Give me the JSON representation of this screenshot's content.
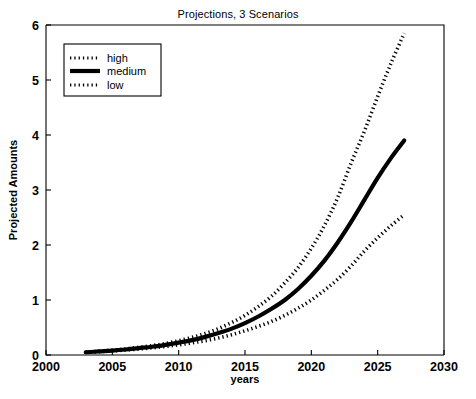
{
  "chart_data": {
    "type": "line",
    "title": "Projections, 3 Scenarios",
    "xlabel": "years",
    "ylabel": "Projected Amounts",
    "xlim": [
      2000,
      2030
    ],
    "ylim": [
      0,
      6
    ],
    "xticks": [
      2000,
      2005,
      2010,
      2015,
      2020,
      2025,
      2030
    ],
    "yticks": [
      0,
      1,
      2,
      3,
      4,
      5,
      6
    ],
    "grid": false,
    "legend_position": "upper-left",
    "x": [
      2003,
      2004,
      2005,
      2006,
      2007,
      2008,
      2009,
      2010,
      2011,
      2012,
      2013,
      2014,
      2015,
      2016,
      2017,
      2018,
      2019,
      2020,
      2021,
      2022,
      2023,
      2024,
      2025,
      2026,
      2027
    ],
    "series": [
      {
        "name": "high",
        "style": "dotted",
        "values": [
          0.05,
          0.07,
          0.09,
          0.11,
          0.14,
          0.17,
          0.21,
          0.26,
          0.32,
          0.39,
          0.48,
          0.59,
          0.72,
          0.88,
          1.07,
          1.31,
          1.59,
          1.94,
          2.36,
          2.87,
          3.49,
          4.07,
          4.7,
          5.3,
          5.85
        ]
      },
      {
        "name": "medium",
        "style": "solid",
        "values": [
          0.05,
          0.065,
          0.08,
          0.1,
          0.125,
          0.15,
          0.185,
          0.225,
          0.27,
          0.33,
          0.4,
          0.48,
          0.58,
          0.7,
          0.84,
          1.0,
          1.2,
          1.44,
          1.72,
          2.05,
          2.42,
          2.82,
          3.22,
          3.58,
          3.9
        ]
      },
      {
        "name": "low",
        "style": "dotted",
        "values": [
          0.05,
          0.06,
          0.075,
          0.09,
          0.11,
          0.13,
          0.155,
          0.185,
          0.22,
          0.26,
          0.31,
          0.37,
          0.44,
          0.52,
          0.61,
          0.72,
          0.85,
          1.0,
          1.18,
          1.38,
          1.62,
          1.89,
          2.13,
          2.35,
          2.55
        ]
      }
    ]
  },
  "legend": {
    "entries": [
      {
        "label": "high"
      },
      {
        "label": "medium"
      },
      {
        "label": "low"
      }
    ]
  },
  "axes": {
    "x_tick_labels": [
      "2000",
      "2005",
      "2010",
      "2015",
      "2020",
      "2025",
      "2030"
    ],
    "y_tick_labels": [
      "0",
      "1",
      "2",
      "3",
      "4",
      "5",
      "6"
    ]
  }
}
